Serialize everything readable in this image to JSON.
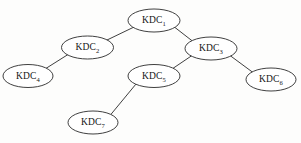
{
  "diagram": {
    "type": "tree",
    "background_color": "#fdfdfc",
    "line_color": "#2a2a2a",
    "node_fill": "#ffffff",
    "nodes": [
      {
        "id": "kdc1",
        "base": "KDC",
        "sub": "1",
        "label": "KDC1",
        "cx": 154,
        "cy": 20.5,
        "rx": 26,
        "ry": 11.5
      },
      {
        "id": "kdc2",
        "base": "KDC",
        "sub": "2",
        "label": "KDC2",
        "cx": 87.5,
        "cy": 47.5,
        "rx": 26,
        "ry": 11.5
      },
      {
        "id": "kdc3",
        "base": "KDC",
        "sub": "3",
        "label": "KDC3",
        "cx": 211,
        "cy": 48.5,
        "rx": 26,
        "ry": 11.5
      },
      {
        "id": "kdc4",
        "base": "KDC",
        "sub": "4",
        "label": "KDC4",
        "cx": 28,
        "cy": 76,
        "rx": 25,
        "ry": 11.5
      },
      {
        "id": "kdc5",
        "base": "KDC",
        "sub": "5",
        "label": "KDC5",
        "cx": 154,
        "cy": 76,
        "rx": 26,
        "ry": 11.5
      },
      {
        "id": "kdc6",
        "base": "KDC",
        "sub": "6",
        "label": "KDC6",
        "cx": 271,
        "cy": 79.5,
        "rx": 25,
        "ry": 11.5
      },
      {
        "id": "kdc7",
        "base": "KDC",
        "sub": "7",
        "label": "KDC7",
        "cx": 93,
        "cy": 122.5,
        "rx": 25,
        "ry": 11.5
      }
    ],
    "edges": [
      {
        "id": "edge-kdc1-kdc2",
        "from": "kdc1",
        "to": "kdc2",
        "x1": 133,
        "y1": 27.5,
        "x2": 106,
        "y2": 40.5
      },
      {
        "id": "edge-kdc1-kdc3",
        "from": "kdc1",
        "to": "kdc3",
        "x1": 175,
        "y1": 27.5,
        "x2": 193,
        "y2": 41.5
      },
      {
        "id": "edge-kdc2-kdc4",
        "from": "kdc2",
        "to": "kdc4",
        "x1": 68,
        "y1": 54.5,
        "x2": 45,
        "y2": 69
      },
      {
        "id": "edge-kdc3-kdc5",
        "from": "kdc3",
        "to": "kdc5",
        "x1": 192,
        "y1": 55.5,
        "x2": 172,
        "y2": 69
      },
      {
        "id": "edge-kdc3-kdc6",
        "from": "kdc3",
        "to": "kdc6",
        "x1": 230,
        "y1": 55.5,
        "x2": 253,
        "y2": 72.5
      },
      {
        "id": "edge-kdc5-kdc7",
        "from": "kdc5",
        "to": "kdc7",
        "x1": 136,
        "y1": 84,
        "x2": 110,
        "y2": 115.5
      }
    ]
  }
}
